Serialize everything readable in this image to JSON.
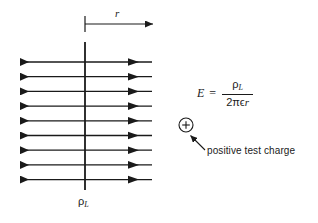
{
  "figure": {
    "background_color": "#ffffff",
    "line_color": "#1a1a1a",
    "text_color": "#1a1a1a",
    "width": 318,
    "height": 223
  },
  "radial_axis": {
    "label": "r",
    "tick_x": 85,
    "arrow_y": 24,
    "arrow_tip_x": 157,
    "label_x": 115,
    "label_y": 8
  },
  "line_charge": {
    "label_symbol": "ρ",
    "label_subscript": "L",
    "axis_x": 85,
    "axis_top_y": 42,
    "axis_bottom_y": 190,
    "label_x": 78,
    "label_y": 196
  },
  "field_lines": {
    "count": 9,
    "left_x": 18,
    "right_x": 152,
    "center_x": 85,
    "first_y": 62,
    "spacing": 14.7,
    "left_arrow_tip_x": 33,
    "right_arrow_tip_x": 137,
    "direction_left": "left",
    "direction_right": "right"
  },
  "equation": {
    "lhs": "E",
    "equals": "=",
    "numerator_symbol": "ρ",
    "numerator_subscript": "L",
    "denominator_prefix": "2πϵ",
    "denominator_var": "r",
    "x": 197,
    "y": 79
  },
  "test_charge": {
    "symbol": "+",
    "caption": "positive test charge",
    "circle_cx": 186,
    "circle_cy": 125,
    "circle_r": 7,
    "pointer_from_x": 205,
    "pointer_from_y": 150,
    "pointer_to_x": 190,
    "pointer_to_y": 136,
    "caption_x": 207,
    "caption_y": 146
  },
  "colors": {
    "stroke": "#1a1a1a",
    "background": "#ffffff"
  }
}
